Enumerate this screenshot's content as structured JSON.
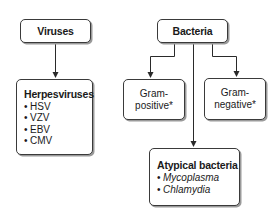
{
  "diagram": {
    "viruses": {
      "title": "Viruses",
      "child": {
        "heading": "Herpesviruses",
        "items": [
          "HSV",
          "VZV",
          "EBV",
          "CMV"
        ]
      }
    },
    "bacteria": {
      "title": "Bacteria",
      "gram_positive": {
        "line1": "Gram-",
        "line2": "positive*"
      },
      "gram_negative": {
        "line1": "Gram-",
        "line2": "negative*"
      },
      "atypical": {
        "heading": "Atypical bacteria",
        "items": [
          "Mycoplasma",
          "Chlamydia"
        ]
      }
    }
  },
  "colors": {
    "line": "#2a2a2a",
    "box_border": "#3a3a3a",
    "shadow": "#9a9a9a",
    "background": "#ffffff"
  }
}
